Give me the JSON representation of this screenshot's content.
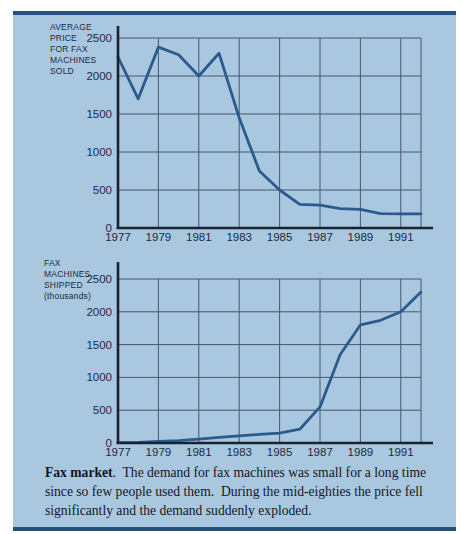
{
  "figure": {
    "panel_color": "#aac7e0",
    "rule_color": "#24517d",
    "line_color": "#2b5b8d",
    "grid_color": "#47566c",
    "axis_color": "#19222f",
    "text_color": "#1b2a40"
  },
  "caption": {
    "bold_lead": "Fax market",
    "body": ".  The demand for fax machines was small for a long time since so few people used them.  During the mid-eighties the price fell significantly and the demand suddenly exploded."
  },
  "chart_data": [
    {
      "type": "line",
      "ylabel": "AVERAGE PRICE FOR FAX MACHINES SOLD",
      "ylabel_lines": [
        "AVERAGE",
        "PRICE",
        "FOR FAX",
        "MACHINES",
        "SOLD"
      ],
      "x": [
        1977,
        1978,
        1979,
        1980,
        1981,
        1982,
        1983,
        1984,
        1985,
        1986,
        1987,
        1988,
        1989,
        1990,
        1991,
        1992
      ],
      "values": [
        2250,
        1700,
        2380,
        2280,
        2000,
        2300,
        1450,
        750,
        500,
        310,
        300,
        255,
        245,
        190,
        185,
        185
      ],
      "xlim": [
        1977,
        1992
      ],
      "ylim": [
        0,
        2500
      ],
      "y_ticks": [
        0,
        500,
        1000,
        1500,
        2000,
        2500
      ],
      "x_tick_years": [
        1977,
        1979,
        1981,
        1983,
        1985,
        1987,
        1989,
        1991
      ],
      "x_tick_labels": [
        "1977",
        "1979",
        "1981",
        "1983",
        "1985",
        "1987",
        "1989",
        "1991"
      ],
      "grid": true,
      "legend": false
    },
    {
      "type": "line",
      "ylabel": "FAX MACHINES SHIPPED (thousands)",
      "ylabel_lines": [
        "FAX",
        "MACHINES",
        "SHIPPED",
        "(thousands)"
      ],
      "x": [
        1977,
        1978,
        1979,
        1980,
        1981,
        1982,
        1983,
        1984,
        1985,
        1986,
        1987,
        1988,
        1989,
        1990,
        1991,
        1992
      ],
      "values": [
        5,
        10,
        25,
        35,
        60,
        85,
        110,
        130,
        150,
        210,
        550,
        1350,
        1800,
        1870,
        2000,
        2300
      ],
      "xlim": [
        1977,
        1992
      ],
      "ylim": [
        0,
        2500
      ],
      "y_ticks": [
        0,
        500,
        1000,
        1500,
        2000,
        2500
      ],
      "x_tick_years": [
        1977,
        1979,
        1981,
        1983,
        1985,
        1987,
        1989,
        1991
      ],
      "x_tick_labels": [
        "1977",
        "1979",
        "1981",
        "1983",
        "1985",
        "1987",
        "1989",
        "1991"
      ],
      "grid": true,
      "legend": false
    }
  ]
}
